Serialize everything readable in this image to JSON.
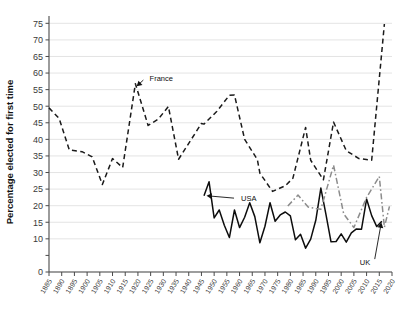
{
  "chart_data": {
    "type": "line",
    "title": "",
    "xlabel": "",
    "ylabel": "Percentage elected for first time",
    "xlim": [
      1885,
      2020
    ],
    "ylim": [
      0,
      76
    ],
    "grid": true,
    "legend": "annotations",
    "ytick_labels": [
      "0",
      "",
      "10",
      "15",
      "20",
      "25",
      "30",
      "35",
      "40",
      "45",
      "50",
      "55",
      "60",
      "65",
      "70",
      "75"
    ],
    "ytick_values": [
      0,
      5,
      10,
      15,
      20,
      25,
      30,
      35,
      40,
      45,
      50,
      55,
      60,
      65,
      70,
      75
    ],
    "xtick_labels": [
      "1885",
      "1890",
      "1895",
      "1900",
      "1905",
      "1910",
      "1915",
      "1920",
      "1925",
      "1930",
      "1935",
      "1940",
      "1945",
      "1950",
      "1955",
      "1960",
      "1965",
      "1970",
      "1975",
      "1980",
      "1985",
      "1990",
      "1995",
      "2000",
      "2005",
      "2010",
      "2015",
      "2020"
    ],
    "xtick_values": [
      1885,
      1890,
      1895,
      1900,
      1905,
      1910,
      1915,
      1920,
      1925,
      1930,
      1935,
      1940,
      1945,
      1950,
      1955,
      1960,
      1965,
      1970,
      1975,
      1980,
      1985,
      1990,
      1995,
      2000,
      2005,
      2010,
      2015,
      2020
    ],
    "series": [
      {
        "name": "France",
        "color": "#1a1a1a",
        "style": "dashed",
        "width": 1.5,
        "points": [
          [
            1885,
            49.5
          ],
          [
            1889,
            46.3
          ],
          [
            1893,
            36.8
          ],
          [
            1898,
            36.3
          ],
          [
            1902,
            34.7
          ],
          [
            1906,
            26.4
          ],
          [
            1910,
            34.2
          ],
          [
            1914,
            31.5
          ],
          [
            1919,
            56.8
          ],
          [
            1924,
            44.2
          ],
          [
            1928,
            46.1
          ],
          [
            1932,
            49.9
          ],
          [
            1936,
            34.0
          ],
          [
            1945,
            44.8
          ],
          [
            1946,
            44.6
          ],
          [
            1951,
            48.4
          ],
          [
            1956,
            53.3
          ],
          [
            1958,
            53.4
          ],
          [
            1962,
            40.0
          ],
          [
            1967,
            33.9
          ],
          [
            1968,
            29.8
          ],
          [
            1973,
            24.3
          ],
          [
            1978,
            26.0
          ],
          [
            1981,
            28.3
          ],
          [
            1986,
            43.6
          ],
          [
            1988,
            33.7
          ],
          [
            1993,
            27.8
          ],
          [
            1997,
            45.2
          ],
          [
            2002,
            36.6
          ],
          [
            2007,
            34.2
          ],
          [
            2012,
            33.7
          ],
          [
            2017,
            74.8
          ]
        ]
      },
      {
        "name": "USA",
        "color": "#0d0d0d",
        "style": "solid",
        "width": 1.5,
        "points": [
          [
            1946,
            23.0
          ],
          [
            1948,
            27.2
          ],
          [
            1950,
            16.3
          ],
          [
            1952,
            18.7
          ],
          [
            1954,
            14.1
          ],
          [
            1956,
            10.4
          ],
          [
            1958,
            18.7
          ],
          [
            1960,
            13.4
          ],
          [
            1962,
            16.5
          ],
          [
            1964,
            20.9
          ],
          [
            1966,
            16.7
          ],
          [
            1968,
            8.8
          ],
          [
            1970,
            13.8
          ],
          [
            1972,
            20.9
          ],
          [
            1974,
            15.3
          ],
          [
            1976,
            17.2
          ],
          [
            1978,
            18.1
          ],
          [
            1980,
            16.9
          ],
          [
            1982,
            9.7
          ],
          [
            1984,
            11.4
          ],
          [
            1986,
            7.2
          ],
          [
            1988,
            9.9
          ],
          [
            1990,
            15.6
          ],
          [
            1992,
            25.3
          ],
          [
            1994,
            17.4
          ],
          [
            1996,
            9.1
          ],
          [
            1998,
            9.2
          ],
          [
            2000,
            11.5
          ],
          [
            2002,
            9.0
          ],
          [
            2004,
            11.8
          ],
          [
            2006,
            13.0
          ],
          [
            2008,
            12.9
          ],
          [
            2010,
            22.0
          ],
          [
            2012,
            17.0
          ],
          [
            2014,
            13.7
          ],
          [
            2016,
            15.3
          ]
        ]
      },
      {
        "name": "UK",
        "color": "#8c8c8c",
        "style": "dashdot",
        "width": 1.5,
        "points": [
          [
            1979,
            19.9
          ],
          [
            1983,
            23.2
          ],
          [
            1987,
            19.6
          ],
          [
            1992,
            18.9
          ],
          [
            1997,
            32.2
          ],
          [
            2001,
            17.5
          ],
          [
            2005,
            13.4
          ],
          [
            2010,
            22.5
          ],
          [
            2015,
            28.8
          ],
          [
            2017,
            13.5
          ],
          [
            2019,
            19.8
          ]
        ]
      }
    ],
    "annotations": [
      {
        "label": "France",
        "text_x": 1923,
        "text_y": 58.5,
        "arrow_to_x": 1919.5,
        "arrow_to_y": 56.0
      },
      {
        "label": "USA",
        "text_x": 1959,
        "text_y": 22.2,
        "arrow_to_x": 1947.0,
        "arrow_to_y": 23.0
      },
      {
        "label": "UK",
        "text_x": 2013,
        "text_y": 3.0,
        "arrow_to_x": 2015.8,
        "arrow_to_y": 14.9
      }
    ]
  }
}
